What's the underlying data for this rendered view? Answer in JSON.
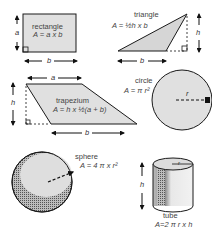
{
  "shapes": {
    "rectangle": {
      "name": "rectangle",
      "formula": "A = a x b",
      "side_label": "a",
      "base_label": "b"
    },
    "triangle": {
      "name": "triangle",
      "formula": "A = ½h x b",
      "height_label": "h",
      "base_label": "b"
    },
    "trapezium": {
      "name": "trapezium",
      "formula": "A = h x ½(a + b)",
      "top_label": "a",
      "height_label": "h",
      "base_label": "b"
    },
    "circle": {
      "name": "circle",
      "formula": "A = π r²",
      "radius_label": "r"
    },
    "sphere": {
      "name": "sphere",
      "formula": "A = 4 π x r²"
    },
    "tube": {
      "name": "tube",
      "formula": "A=2 π r x h",
      "radius_label": "r",
      "height_label": "h"
    }
  },
  "colors": {
    "fill": "#e0e0e0",
    "stroke": "#1a1a1a",
    "text": "#444444"
  }
}
